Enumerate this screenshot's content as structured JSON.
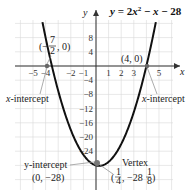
{
  "chart_data": {
    "type": "line",
    "equation": "y = 2x^2 - x - 28",
    "xlabel": "x",
    "ylabel": "y",
    "xlim": [
      -6.4,
      6
    ],
    "ylim": [
      -32,
      14
    ],
    "grid": true,
    "x_ticks": [
      -5,
      -4,
      -2,
      -1,
      1,
      2,
      3,
      5
    ],
    "y_ticks": [
      8,
      4,
      -4,
      -8,
      -12,
      -16,
      -20,
      -24
    ],
    "annotations": [
      {
        "label": "x-intercept",
        "point": "(-7/2, 0)",
        "x": -3.5,
        "y": 0
      },
      {
        "label": "x-intercept",
        "point": "(4, 0)",
        "x": 4,
        "y": 0
      },
      {
        "label": "y-intercept",
        "point": "(0, -28)",
        "x": 0,
        "y": -28
      },
      {
        "label": "Vertex",
        "point": "(1/4, -28 1/8)",
        "x": 0.25,
        "y": -28.125
      }
    ]
  },
  "labels": {
    "x_axis": "x",
    "y_axis": "y",
    "x_intercept_left_label": "x-intercept",
    "x_intercept_right_label": "x-intercept",
    "left_point": "(−7/2, 0)",
    "right_point": "(4, 0)",
    "y_intercept_label": "y-intercept",
    "y_intercept_point": "(0, −28)",
    "vertex_label": "Vertex",
    "vertex_point": "(1/4, −28 1/8)"
  },
  "colors": {
    "curve": "#111111",
    "grid": "#d8d8d8",
    "axis": "#333333",
    "leader": "#888888",
    "point": "#666666"
  }
}
